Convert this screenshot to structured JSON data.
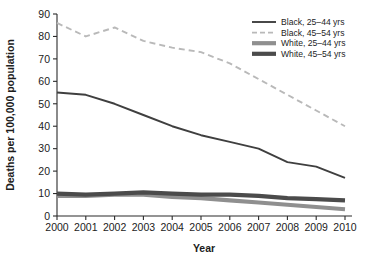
{
  "chart_data": {
    "type": "line",
    "title": "",
    "xlabel": "Year",
    "ylabel": "Deaths per 100,000 population",
    "x": [
      2000,
      2001,
      2002,
      2003,
      2004,
      2005,
      2006,
      2007,
      2008,
      2009,
      2010
    ],
    "categories": [
      "2000",
      "2001",
      "2002",
      "2003",
      "2004",
      "2005",
      "2006",
      "2007",
      "2008",
      "2009",
      "2010"
    ],
    "xlim": [
      2000,
      2010
    ],
    "ylim": [
      0,
      90
    ],
    "ytick_values": [
      0,
      10,
      20,
      30,
      40,
      50,
      60,
      70,
      80,
      90
    ],
    "ytick_labels": [
      "0",
      "10",
      "20",
      "30",
      "40",
      "50",
      "60",
      "70",
      "80",
      "90"
    ],
    "grid": false,
    "legend_position": "top-right",
    "series": [
      {
        "name": "Black, 25–44 yrs",
        "values": [
          55,
          54,
          50,
          45,
          40,
          36,
          33,
          30,
          24,
          22,
          17
        ],
        "color": "#3f3f3f",
        "style": "solid",
        "width": 1.9
      },
      {
        "name": "Black, 45–54 yrs",
        "values": [
          86,
          80,
          84,
          78,
          75,
          73,
          68,
          61,
          54,
          47,
          40
        ],
        "color": "#b9b9b9",
        "style": "dashed",
        "width": 1.9
      },
      {
        "name": "White, 25–44 yrs",
        "values": [
          9,
          9,
          9.5,
          9.5,
          8.5,
          8,
          7,
          6,
          5,
          4,
          3
        ],
        "color": "#8f8f8f",
        "style": "solid",
        "width": 4.2
      },
      {
        "name": "White, 45–54 yrs",
        "values": [
          10,
          9.5,
          10,
          10.5,
          10,
          9.5,
          9.5,
          9,
          8,
          7.5,
          7
        ],
        "color": "#4b4b4b",
        "style": "solid",
        "width": 4.2
      }
    ]
  },
  "axes": {
    "y_title": "Deaths per 100,000 population",
    "x_title": "Year"
  },
  "legend": {
    "entries": [
      {
        "label": "Black, 25–44 yrs"
      },
      {
        "label": "Black, 45–54 yrs"
      },
      {
        "label": "White, 25–44 yrs"
      },
      {
        "label": "White, 45–54 yrs"
      }
    ]
  },
  "colors": {
    "axis": "#2b2b2b",
    "background": "#ffffff",
    "text": "#1c1c1c"
  }
}
